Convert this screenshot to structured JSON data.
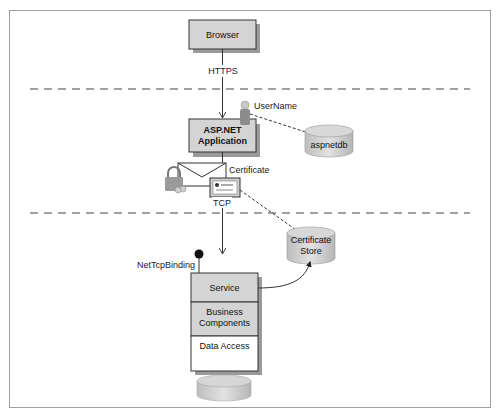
{
  "diagram": {
    "nodes": {
      "browser": {
        "label": "Browser"
      },
      "aspnet": {
        "label_line1": "ASP.NET",
        "label_line2": "Application"
      },
      "aspnetdb": {
        "label": "aspnetdb"
      },
      "cert_store": {
        "label_line1": "Certificate",
        "label_line2": "Store"
      },
      "service_stack": {
        "layers": [
          {
            "label_line1": "Service"
          },
          {
            "label_line1": "Business",
            "label_line2": "Components"
          },
          {
            "label_line1": "Data Access"
          }
        ]
      },
      "database": {
        "label": ""
      }
    },
    "labels": {
      "https": "HTTPS",
      "username": "UserName",
      "certificate": "Certificate",
      "tcp": "TCP",
      "binding": "NetTcpBinding"
    },
    "icons": [
      "user-icon",
      "envelope-icon",
      "lock-icon",
      "certificate-icon",
      "endpoint-dot-icon"
    ],
    "colors": {
      "box_fill": "#d4d4d4",
      "box_shadow": "#9a9a9a",
      "cylinder_fill": "#c8c8c8",
      "line": "#333333",
      "frame": "#a0a0a0"
    }
  }
}
